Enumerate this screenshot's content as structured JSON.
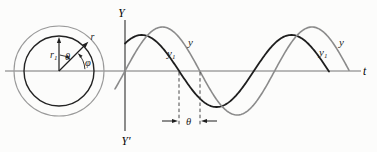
{
  "figure": {
    "background": "#fcfcfb",
    "canvas": {
      "width": 377,
      "height": 152
    },
    "colors": {
      "dark": "#1e1e1e",
      "gray": "#8b8b8b",
      "axis_h": "#757575",
      "axis_v": "#2e2e2e",
      "outer_circle": "#9a9a9a",
      "inner_circle": "#232323"
    },
    "axes": {
      "horizontal": {
        "x1": 5,
        "x2": 361,
        "y": 71,
        "label": "t",
        "label_x": 363,
        "label_y": 75
      },
      "vertical": {
        "x": 125,
        "y1": 20,
        "y2": 131,
        "label_top": "Y",
        "label_top_x": 121.5,
        "label_top_y": 17,
        "label_bottom": "Y′",
        "label_bottom_x": 126,
        "label_bottom_y": 145
      }
    },
    "reference_circle": {
      "cx": 59,
      "cy": 71,
      "outer_radius": 45,
      "inner_radius": 35,
      "vectors": [
        {
          "name": "r1",
          "angle_deg": 90,
          "length": 34,
          "label": "r",
          "label_sub": "1",
          "label_x": 50,
          "label_y": 58
        },
        {
          "name": "r",
          "angle_deg": 45,
          "length": 41.5,
          "label": "r",
          "label_sub": "",
          "label_x": 90.5,
          "label_y": 40
        }
      ],
      "angle_arcs": [
        {
          "name": "theta",
          "radius": 16,
          "from_deg": 47,
          "to_deg": 87,
          "arrow_at_deg": 47,
          "arrow_dir": "cw",
          "label": "θ",
          "label_x": 67.5,
          "label_y": 59.5
        },
        {
          "name": "phi",
          "radius": 26,
          "from_deg": 4,
          "to_deg": 42,
          "arrow_at_deg": 42,
          "arrow_dir": "ccw",
          "label": "φ",
          "label_x": 88,
          "label_y": 66
        }
      ]
    },
    "waves": {
      "phase_ref_x": 125,
      "baseline_y": 71,
      "series": [
        {
          "name": "y1",
          "color_key": "dark",
          "amplitude_px": 36,
          "omega_rad_per_px": 0.042,
          "phase_rad": 0.87,
          "x_start": 125,
          "x_end": 329,
          "stroke_width": 1.8
        },
        {
          "name": "y",
          "color_key": "gray",
          "amplitude_px": 44,
          "omega_rad_per_px": 0.042,
          "phase_rad": 0,
          "x_start": 115,
          "x_end": 349,
          "stroke_width": 1.6
        }
      ]
    },
    "wave_labels": [
      {
        "text": "y",
        "sub": "1",
        "x": 167,
        "y": 57
      },
      {
        "text": "y",
        "sub": "",
        "x": 188,
        "y": 46
      },
      {
        "text": "y",
        "sub": "1",
        "x": 319,
        "y": 56
      },
      {
        "text": "y",
        "sub": "",
        "x": 339,
        "y": 46
      }
    ],
    "phase_marker": {
      "dash_x1": 179,
      "dash_x2": 200,
      "dash_top": 72,
      "dash_bottom": 126,
      "arrow_y": 121,
      "arrow_tail": 17,
      "label": "θ",
      "label_x": 188.5,
      "label_y": 124.5
    }
  }
}
